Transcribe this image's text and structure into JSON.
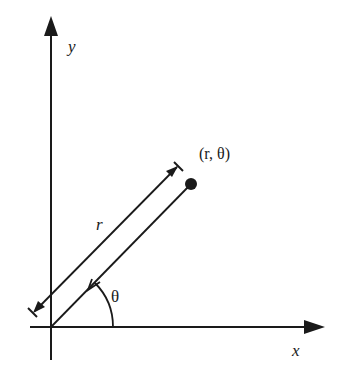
{
  "diagram": {
    "type": "polar-coordinates",
    "labels": {
      "y_axis": "y",
      "x_axis": "x",
      "point": "(r, θ)",
      "radius": "r",
      "angle": "θ"
    },
    "colors": {
      "ink": "#1a1a1a",
      "background": "#ffffff"
    }
  }
}
